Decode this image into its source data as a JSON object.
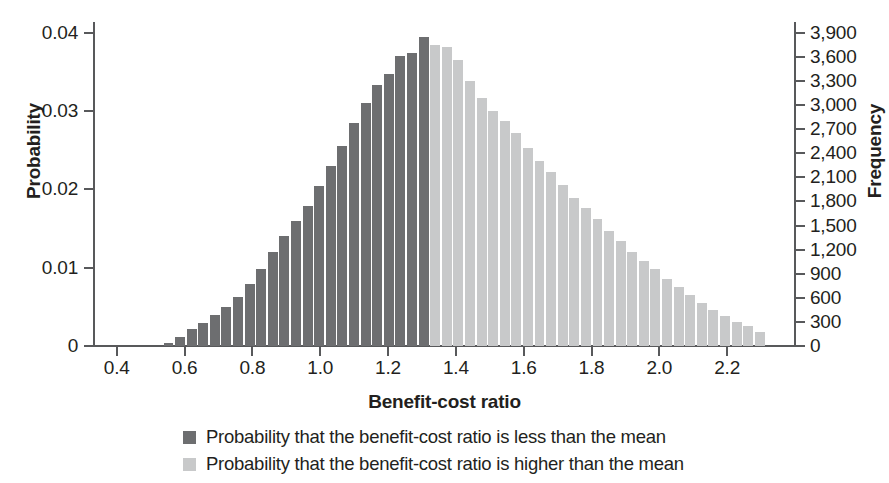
{
  "chart_data": {
    "type": "bar",
    "title": "",
    "xlabel": "Benefit-cost ratio",
    "ylabel": "Probability",
    "ylabel_secondary": "Frequency",
    "grid": false,
    "legend_position": "bottom",
    "xlim": [
      0.33,
      2.4
    ],
    "ylim": [
      0,
      0.0414
    ],
    "ylim_secondary": [
      0,
      4035
    ],
    "xticks": [
      "0.4",
      "0.6",
      "0.8",
      "1.0",
      "1.2",
      "1.4",
      "1.6",
      "1.8",
      "2.0",
      "2.2"
    ],
    "xtick_values": [
      0.4,
      0.6,
      0.8,
      1.0,
      1.2,
      1.4,
      1.6,
      1.8,
      2.0,
      2.2
    ],
    "yticks": [
      "0",
      "0.01",
      "0.02",
      "0.03",
      "0.04"
    ],
    "ytick_values": [
      0,
      0.01,
      0.02,
      0.03,
      0.04
    ],
    "yticks_secondary": [
      "0",
      "300",
      "600",
      "900",
      "1,200",
      "1,500",
      "1,800",
      "2,100",
      "2,400",
      "2,700",
      "3,000",
      "3,300",
      "3,600",
      "3,900"
    ],
    "ytick_values_secondary": [
      0,
      300,
      600,
      900,
      1200,
      1500,
      1800,
      2100,
      2400,
      2700,
      3000,
      3300,
      3600,
      3900
    ],
    "mean_split_x": 1.335,
    "bin_width": 0.0342,
    "colors": {
      "below_mean": "#6d6e70",
      "above_mean": "#c8c9ca",
      "axis": "#58595b",
      "text": "#231f20"
    },
    "series": [
      {
        "name": "Probability that the benefit-cost ratio is less than the mean",
        "color": "#6d6e70",
        "x": [
          0.555,
          0.589,
          0.623,
          0.658,
          0.692,
          0.726,
          0.76,
          0.794,
          0.829,
          0.863,
          0.897,
          0.931,
          0.965,
          1.0,
          1.034,
          1.068,
          1.102,
          1.136,
          1.171,
          1.205,
          1.239,
          1.273,
          1.307
        ],
        "values": [
          0.0004,
          0.0011,
          0.0022,
          0.0029,
          0.004,
          0.005,
          0.0063,
          0.0079,
          0.0099,
          0.012,
          0.014,
          0.016,
          0.0179,
          0.0205,
          0.023,
          0.0255,
          0.0285,
          0.031,
          0.0333,
          0.0347,
          0.037,
          0.0374,
          0.0395
        ]
      },
      {
        "name": "Probability that the benefit-cost ratio is higher than the mean",
        "color": "#c8c9ca",
        "x": [
          1.342,
          1.376,
          1.41,
          1.444,
          1.478,
          1.513,
          1.547,
          1.581,
          1.615,
          1.649,
          1.684,
          1.718,
          1.752,
          1.786,
          1.82,
          1.855,
          1.889,
          1.923,
          1.957,
          1.991,
          2.026,
          2.06,
          2.094,
          2.128,
          2.162,
          2.197,
          2.231,
          2.265,
          2.299
        ],
        "values": [
          0.0384,
          0.0382,
          0.0365,
          0.0338,
          0.0317,
          0.03,
          0.0288,
          0.0272,
          0.0253,
          0.0236,
          0.0222,
          0.0206,
          0.0189,
          0.0176,
          0.0162,
          0.0147,
          0.0134,
          0.012,
          0.0108,
          0.0098,
          0.0086,
          0.0075,
          0.0065,
          0.0055,
          0.0046,
          0.0038,
          0.0031,
          0.0025,
          0.0018
        ]
      }
    ],
    "peak_of_dark_series": {
      "x": 1.307,
      "value": 0.0395
    }
  },
  "legend": [
    {
      "swatch": "low",
      "label": "Probability that the benefit-cost ratio is less than the mean"
    },
    {
      "swatch": "high",
      "label": "Probability that the benefit-cost ratio is higher than the mean"
    }
  ]
}
